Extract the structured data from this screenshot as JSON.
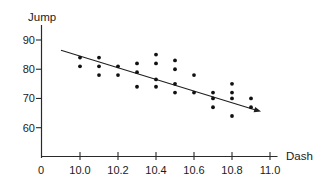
{
  "chart_data": {
    "type": "scatter",
    "title": "",
    "xlabel": "Dash",
    "ylabel": "Jump",
    "origin_label": "0",
    "xlim": [
      10.0,
      11.0
    ],
    "ylim": [
      60,
      90
    ],
    "x_ticks": [
      10.0,
      10.2,
      10.4,
      10.6,
      10.8,
      11.0
    ],
    "x_tick_labels": [
      "10.0",
      "10.2",
      "10.4",
      "10.6",
      "10.8",
      "11.0"
    ],
    "y_ticks": [
      90,
      80,
      70,
      60
    ],
    "y_tick_labels": [
      "90",
      "80",
      "70",
      "60"
    ],
    "grid": false,
    "legend": "none",
    "marker_color": "#111111",
    "axis_color": "#2a2a2a",
    "line_color": "#1f1f1f",
    "points": [
      {
        "dash": 10.0,
        "jump": 84
      },
      {
        "dash": 10.0,
        "jump": 81
      },
      {
        "dash": 10.1,
        "jump": 84
      },
      {
        "dash": 10.1,
        "jump": 81
      },
      {
        "dash": 10.1,
        "jump": 78
      },
      {
        "dash": 10.2,
        "jump": 81
      },
      {
        "dash": 10.2,
        "jump": 78
      },
      {
        "dash": 10.3,
        "jump": 82
      },
      {
        "dash": 10.3,
        "jump": 79
      },
      {
        "dash": 10.3,
        "jump": 74
      },
      {
        "dash": 10.4,
        "jump": 85
      },
      {
        "dash": 10.4,
        "jump": 82
      },
      {
        "dash": 10.4,
        "jump": 76.5
      },
      {
        "dash": 10.4,
        "jump": 74
      },
      {
        "dash": 10.5,
        "jump": 83
      },
      {
        "dash": 10.5,
        "jump": 80
      },
      {
        "dash": 10.5,
        "jump": 75
      },
      {
        "dash": 10.5,
        "jump": 72
      },
      {
        "dash": 10.6,
        "jump": 78
      },
      {
        "dash": 10.6,
        "jump": 72
      },
      {
        "dash": 10.7,
        "jump": 72
      },
      {
        "dash": 10.7,
        "jump": 70
      },
      {
        "dash": 10.7,
        "jump": 67
      },
      {
        "dash": 10.8,
        "jump": 75
      },
      {
        "dash": 10.8,
        "jump": 72
      },
      {
        "dash": 10.8,
        "jump": 70
      },
      {
        "dash": 10.8,
        "jump": 64
      },
      {
        "dash": 10.9,
        "jump": 70
      },
      {
        "dash": 10.9,
        "jump": 67
      }
    ],
    "trendline": {
      "x1": 9.9,
      "y1": 86.5,
      "x2": 10.953,
      "y2": 65.5,
      "arrow_at_end": true
    }
  }
}
